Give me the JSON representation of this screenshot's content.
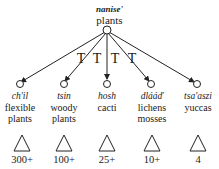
{
  "root": {
    "native": "nanise'",
    "english": "plants"
  },
  "relation_marks": [
    "T",
    "T",
    "T",
    "T"
  ],
  "children": [
    {
      "native": "ch'il",
      "english_line1": "flexible",
      "english_line2": "plants",
      "count": "300+"
    },
    {
      "native": "tsin",
      "english_line1": "woody",
      "english_line2": "plants",
      "count": "100+"
    },
    {
      "native": "hosh",
      "english_line1": "cacti",
      "english_line2": "",
      "count": "25+"
    },
    {
      "native": "dlááď",
      "english_line1": "lichens",
      "english_line2": "mosses",
      "count": "10+"
    },
    {
      "native": "tsa'aszi",
      "english_line1": "yuccas",
      "english_line2": "",
      "count": "4"
    }
  ],
  "colors": {
    "line": "#222222",
    "text": "#1a1a1a",
    "background": "#ffffff"
  }
}
